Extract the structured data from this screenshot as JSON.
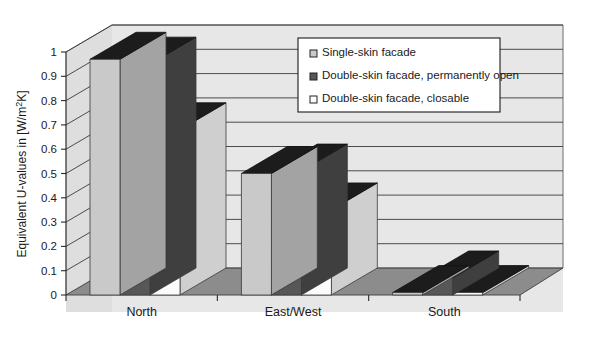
{
  "chart_data": {
    "type": "bar",
    "title": "",
    "subtitle": "",
    "xlabel": "",
    "ylabel": "Equivalent U-values in [W/m²K]",
    "ylabel_parts": {
      "pre": "Equivalent U-values in [W/m",
      "sup": "2",
      "post": "K]"
    },
    "categories": [
      "North",
      "East/West",
      "South"
    ],
    "series": [
      {
        "name": "Single-skin facade",
        "values": [
          0.97,
          0.5,
          0.01
        ],
        "color": "#c9c9c9"
      },
      {
        "name": "Double-skin facade, permanently open",
        "values": [
          0.95,
          0.51,
          0.07
        ],
        "color": "#575757"
      },
      {
        "name": "Double-skin facade, closable",
        "values": [
          0.68,
          0.35,
          0.01
        ],
        "color": "#fbfbfb"
      }
    ],
    "ylim": [
      0,
      1
    ],
    "ytick_step": 0.1,
    "ytick_labels": [
      "0",
      "0.1",
      "0.2",
      "0.3",
      "0.4",
      "0.5",
      "0.6",
      "0.7",
      "0.8",
      "0.9",
      "1"
    ],
    "ytick_values": [
      0,
      0.1,
      0.2,
      0.3,
      0.4,
      0.5,
      0.6,
      0.7,
      0.8,
      0.9,
      1
    ],
    "grid": true,
    "grid_axis": "y",
    "legend_position": "upper-right-inside",
    "style": "3d-column",
    "colors": {
      "back_wall": "#e7e7e7",
      "floor": "#8c8c8c",
      "side_wall": "#d8d8d8",
      "bar_top_cap": "#1c1c1c",
      "gridline": "#3a3a3a",
      "axis_line": "#2a2a2a",
      "legend_bg": "#ffffff",
      "legend_border": "#1a1a1a",
      "plot_border": "#555555"
    }
  },
  "legend": {
    "entries": [
      {
        "label": "Single-skin facade",
        "swatch": "#c9c9c9",
        "swatch_name": "legend-swatch-light-gray"
      },
      {
        "label": "Double-skin facade, permanently open",
        "swatch": "#575757",
        "swatch_name": "legend-swatch-dark-gray"
      },
      {
        "label": "Double-skin facade, closable",
        "swatch": "#fbfbfb",
        "swatch_name": "legend-swatch-white"
      }
    ]
  },
  "axes": {
    "y_title": "Equivalent U-values in [W/m²K]",
    "y_ticks": [
      "1",
      "0.9",
      "0.8",
      "0.7",
      "0.6",
      "0.5",
      "0.4",
      "0.3",
      "0.2",
      "0.1",
      "0"
    ],
    "x_ticks": [
      "North",
      "East/West",
      "South"
    ]
  }
}
